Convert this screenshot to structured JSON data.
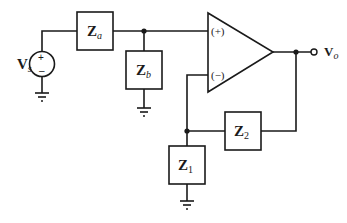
{
  "diagram": {
    "type": "non-inverting op-amp circuit",
    "source": {
      "label": "V",
      "subscript": "s",
      "plus": "+",
      "minus": "–"
    },
    "impedances": {
      "za": {
        "label": "Z",
        "subscript": "a"
      },
      "zb": {
        "label": "Z",
        "subscript": "b"
      },
      "z1": {
        "label": "Z",
        "subscript": "1"
      },
      "z2": {
        "label": "Z",
        "subscript": "2"
      }
    },
    "opamp": {
      "plus_input": "(+)",
      "minus_input": "(−)"
    },
    "output": {
      "label": "V",
      "subscript": "o"
    },
    "colors": {
      "stroke": "#1a1a1a",
      "background": "#ffffff"
    }
  }
}
